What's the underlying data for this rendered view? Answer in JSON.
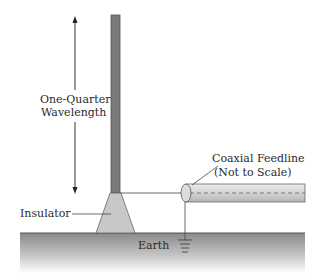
{
  "diagram": {
    "labels": {
      "wavelength_line1": "One-Quarter",
      "wavelength_line2": "Wavelength",
      "insulator": "Insulator",
      "earth": "Earth",
      "feedline_line1": "Coaxial Feedline",
      "feedline_line2": "(Not to Scale)"
    },
    "colors": {
      "mast": "#7a7a7a",
      "mast_edge": "#555555",
      "insulator": "#c8c8c8",
      "ground_top": "#8c8c8c",
      "ground_bottom": "#ffffff",
      "coax": "#d9d9d9",
      "line": "#333333"
    }
  }
}
